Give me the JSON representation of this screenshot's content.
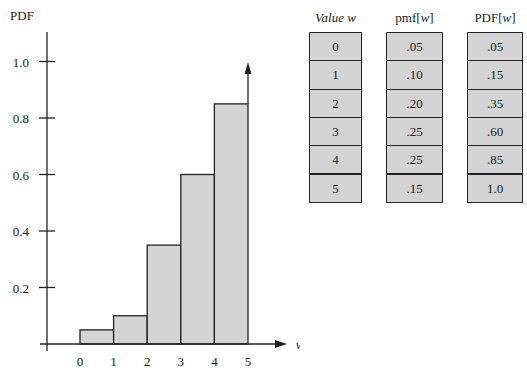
{
  "chart_data": {
    "type": "bar",
    "title": "",
    "ylabel": "PDF",
    "xlabel": "w",
    "ylim": [
      0,
      1.1
    ],
    "yticks": [
      0.2,
      0.4,
      0.6,
      0.8,
      1.0
    ],
    "ytick_labels": [
      "0.2",
      "0.4",
      "0.6",
      "0.8",
      "1.0"
    ],
    "xticks": [
      0,
      1,
      2,
      3,
      4,
      5
    ],
    "xtick_labels": [
      "0",
      "1",
      "2",
      "3",
      "4",
      "5"
    ],
    "grid": false,
    "legend": null,
    "bars": [
      {
        "x_from": 0,
        "x_to": 1,
        "height": 0.05
      },
      {
        "x_from": 1,
        "x_to": 2,
        "height": 0.1
      },
      {
        "x_from": 2,
        "x_to": 3,
        "height": 0.35
      },
      {
        "x_from": 3,
        "x_to": 4,
        "height": 0.6
      },
      {
        "x_from": 4,
        "x_to": 5,
        "height": 0.85
      }
    ],
    "annotations": [
      "upward arrow at w = 5 indicating PDF continues to 1.0"
    ],
    "table": {
      "headers": [
        "Value w",
        "pmf[w]",
        "PDF[w]"
      ],
      "rows": [
        [
          "0",
          ".05",
          ".05"
        ],
        [
          "1",
          ".10",
          ".15"
        ],
        [
          "2",
          ".20",
          ".35"
        ],
        [
          "3",
          ".25",
          ".60"
        ],
        [
          "4",
          ".25",
          ".85"
        ],
        [
          "5",
          ".15",
          "1.0"
        ]
      ]
    }
  },
  "colors": {
    "bar_fill": "#d4d4d4",
    "stroke": "#222222"
  }
}
